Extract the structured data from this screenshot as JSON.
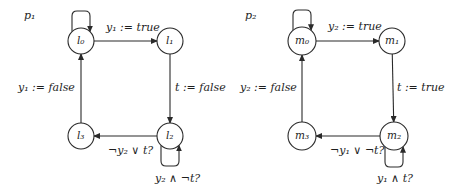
{
  "colors": {
    "stroke": "#2a2a2a",
    "text": "#1e1e1e",
    "background": "#ffffff"
  },
  "processes": [
    {
      "name": "p₁",
      "label_pos": [
        24,
        10
      ],
      "nodes": [
        {
          "id": "l0",
          "label": "l₀",
          "cx": 81,
          "cy": 41,
          "r": 13
        },
        {
          "id": "l1",
          "label": "l₁",
          "cx": 170,
          "cy": 41,
          "r": 13
        },
        {
          "id": "l2",
          "label": "l₂",
          "cx": 170,
          "cy": 136,
          "r": 13
        },
        {
          "id": "l3",
          "label": "l₃",
          "cx": 81,
          "cy": 136,
          "r": 13
        }
      ],
      "edges": [
        {
          "from": "l0",
          "to": "l1",
          "label": "y₁ := true",
          "label_pos": [
            106,
            22
          ]
        },
        {
          "from": "l1",
          "to": "l2",
          "label": "t := false",
          "label_pos": [
            175,
            82
          ]
        },
        {
          "from": "l2",
          "to": "l3",
          "label": "¬y₂ ∨ t?",
          "label_pos": [
            108,
            145
          ]
        },
        {
          "from": "l3",
          "to": "l0",
          "label": "y₁ := false",
          "label_pos": [
            18,
            82
          ]
        }
      ],
      "self_loops": [
        {
          "node": "l0",
          "side": "top",
          "label": ""
        },
        {
          "node": "l2",
          "side": "bottom",
          "label": "y₂ ∧ ¬t?",
          "label_pos": [
            155,
            173
          ]
        }
      ]
    },
    {
      "name": "p₂",
      "label_pos": [
        245,
        10
      ],
      "nodes": [
        {
          "id": "m0",
          "label": "m₀",
          "cx": 302,
          "cy": 41,
          "r": 14
        },
        {
          "id": "m1",
          "label": "m₁",
          "cx": 392,
          "cy": 41,
          "r": 13
        },
        {
          "id": "m2",
          "label": "m₂",
          "cx": 394,
          "cy": 136,
          "r": 14
        },
        {
          "id": "m3",
          "label": "m₃",
          "cx": 302,
          "cy": 136,
          "r": 14
        }
      ],
      "edges": [
        {
          "from": "m0",
          "to": "m1",
          "label": "y₂ := true",
          "label_pos": [
            328,
            21
          ]
        },
        {
          "from": "m1",
          "to": "m2",
          "label": "t := true",
          "label_pos": [
            397,
            82
          ]
        },
        {
          "from": "m2",
          "to": "m3",
          "label": "¬y₁ ∨ ¬t?",
          "label_pos": [
            330,
            145
          ]
        },
        {
          "from": "m3",
          "to": "m0",
          "label": "y₂ := false",
          "label_pos": [
            240,
            82
          ]
        }
      ],
      "self_loops": [
        {
          "node": "m0",
          "side": "top",
          "label": ""
        },
        {
          "node": "m2",
          "side": "bottom",
          "label": "y₁ ∧ t?",
          "label_pos": [
            377,
            173
          ]
        }
      ]
    }
  ]
}
